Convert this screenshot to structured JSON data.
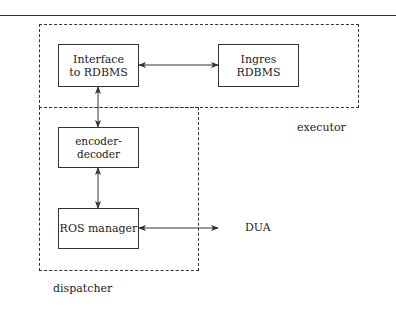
{
  "diagram": {
    "groups": {
      "executor": {
        "label": "executor"
      },
      "dispatcher": {
        "label": "dispatcher"
      }
    },
    "nodes": {
      "interface": {
        "line1": "Interface",
        "line2": "to RDBMS"
      },
      "ingres": {
        "line1": "Ingres",
        "line2": "RDBMS"
      },
      "encoder": {
        "label": "encoder-decoder"
      },
      "ros": {
        "label": "ROS manager"
      },
      "dua": {
        "label": "DUA"
      }
    },
    "edges": [
      {
        "from": "Interface to RDBMS",
        "to": "Ingres RDBMS",
        "type": "bidirectional"
      },
      {
        "from": "Interface to RDBMS",
        "to": "encoder-decoder",
        "type": "bidirectional"
      },
      {
        "from": "encoder-decoder",
        "to": "ROS manager",
        "type": "bidirectional"
      },
      {
        "from": "ROS manager",
        "to": "DUA",
        "type": "bidirectional"
      }
    ]
  }
}
